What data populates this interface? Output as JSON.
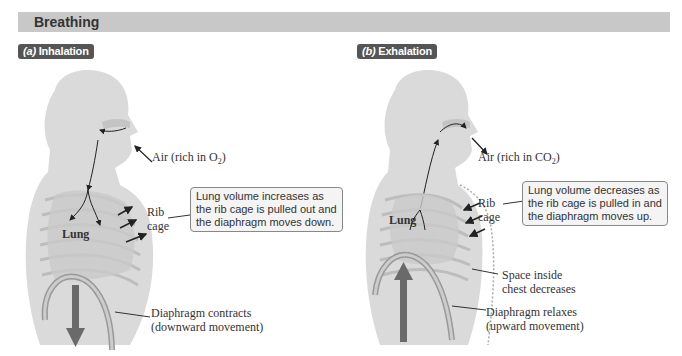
{
  "header": {
    "title": "Breathing"
  },
  "panels": [
    {
      "id": "a",
      "letter": "(a)",
      "title": "Inhalation",
      "air_label": "Air (rich in O",
      "air_sub": "2",
      "air_close": ")",
      "rib_label_1": "Rib",
      "rib_label_2": "cage",
      "lung_label": "Lung",
      "callout_lines": [
        "Lung volume increases as",
        "the rib cage is pulled out and",
        "the diaphragm moves down."
      ],
      "diaphragm_line1": "Diaphragm contracts",
      "diaphragm_line2": "(downward movement)"
    },
    {
      "id": "b",
      "letter": "(b)",
      "title": "Exhalation",
      "air_label": "Air (rich in CO",
      "air_sub": "2",
      "air_close": ")",
      "rib_label_1": "Rib",
      "rib_label_2": "cage",
      "lung_label": "Lung",
      "callout_lines": [
        "Lung volume decreases as",
        "the rib cage is pulled in and",
        "the diaphragm moves up."
      ],
      "space_line1": "Space inside",
      "space_line2": "chest decreases",
      "diaphragm_line1": "Diaphragm relaxes",
      "diaphragm_line2": "(upward movement)"
    }
  ],
  "colors": {
    "header_bg": "#c8c8c8",
    "pill_bg": "#555555",
    "body_fill": "#d9d9d9",
    "arrow": "#666666",
    "diaphragm": "#b0b0b0"
  }
}
